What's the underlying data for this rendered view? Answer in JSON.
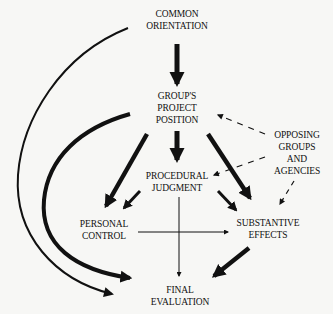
{
  "diagram": {
    "nodes": {
      "common_orientation": {
        "lines": [
          "COMMON",
          "ORIENTATION"
        ]
      },
      "groups_project_position": {
        "lines": [
          "GROUP'S",
          "PROJECT",
          "POSITION"
        ]
      },
      "opposing_groups": {
        "lines": [
          "OPPOSING",
          "GROUPS",
          "AND",
          "AGENCIES"
        ]
      },
      "procedural_judgment": {
        "lines": [
          "PROCEDURAL",
          "JUDGMENT"
        ]
      },
      "personal_control": {
        "lines": [
          "PERSONAL",
          "CONTROL"
        ]
      },
      "substantive_effects": {
        "lines": [
          "SUBSTANTIVE",
          "EFFECTS"
        ]
      },
      "final_evaluation": {
        "lines": [
          "FINAL",
          "EVALUATION"
        ]
      }
    },
    "edges": [
      {
        "from": "common_orientation",
        "to": "groups_project_position",
        "style": "thick"
      },
      {
        "from": "common_orientation",
        "to": "final_evaluation",
        "style": "medium-curve"
      },
      {
        "from": "groups_project_position",
        "to": "final_evaluation",
        "style": "thick-curve"
      },
      {
        "from": "groups_project_position",
        "to": "personal_control",
        "style": "thick"
      },
      {
        "from": "groups_project_position",
        "to": "procedural_judgment",
        "style": "thick"
      },
      {
        "from": "groups_project_position",
        "to": "substantive_effects",
        "style": "thick"
      },
      {
        "from": "opposing_groups",
        "to": "groups_project_position",
        "style": "dashed"
      },
      {
        "from": "opposing_groups",
        "to": "procedural_judgment",
        "style": "dashed"
      },
      {
        "from": "opposing_groups",
        "to": "substantive_effects",
        "style": "dashed"
      },
      {
        "from": "procedural_judgment",
        "to": "personal_control",
        "style": "medium"
      },
      {
        "from": "procedural_judgment",
        "to": "substantive_effects",
        "style": "medium"
      },
      {
        "from": "procedural_judgment",
        "to": "final_evaluation",
        "style": "thin"
      },
      {
        "from": "personal_control",
        "to": "substantive_effects",
        "style": "thin"
      },
      {
        "from": "substantive_effects",
        "to": "final_evaluation",
        "style": "thick"
      }
    ]
  }
}
